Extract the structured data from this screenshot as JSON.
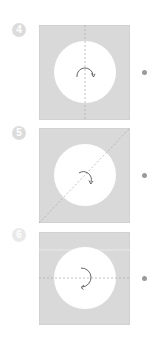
{
  "colors": {
    "panel_fill": "#d9d9d9",
    "circle_fill": "#ffffff",
    "fold_line": "#a8a8a8",
    "arrow": "#555555",
    "badge": "#dcdcdc",
    "dot": "#9a9a9a"
  },
  "steps": [
    {
      "number": "4",
      "fold_line": "vertical",
      "arrow_icon": "rotate-clockwise-icon"
    },
    {
      "number": "5",
      "fold_line": "diagonal",
      "arrow_icon": "rotate-clockwise-icon"
    },
    {
      "number": "6",
      "fold_line": "horizontal",
      "arrow_icon": "rotate-clockwise-icon"
    }
  ]
}
